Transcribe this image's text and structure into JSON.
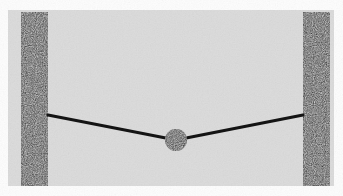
{
  "figure": {
    "kind": "physics-free-body-diagram",
    "canvas": {
      "width": 343,
      "height": 196
    },
    "background": {
      "outer_color": "#fdfdfd",
      "panel_color": "#dcdcdc",
      "panel": {
        "x": 8,
        "y": 10,
        "width": 326,
        "height": 176
      }
    },
    "elements": {
      "left_wall": {
        "label": "left vertical support",
        "color": "#232323",
        "x": 21,
        "y": 12,
        "width": 27,
        "height": 174
      },
      "right_wall": {
        "label": "right vertical support",
        "color": "#232323",
        "x": 303,
        "y": 12,
        "width": 27,
        "height": 174
      },
      "string": {
        "label": "string",
        "color": "#141414",
        "thickness": 3,
        "points": [
          {
            "x": 48,
            "y": 115
          },
          {
            "x": 176,
            "y": 140
          },
          {
            "x": 303,
            "y": 115
          }
        ]
      },
      "mass": {
        "label": "suspended mass",
        "color": "#1a1a1a",
        "cx": 176,
        "cy": 140,
        "r": 11
      },
      "left_anchor": {
        "label": "left string attachment point",
        "x": 48,
        "y": 115
      },
      "right_anchor": {
        "label": "right string attachment point",
        "x": 303,
        "y": 115
      }
    }
  }
}
